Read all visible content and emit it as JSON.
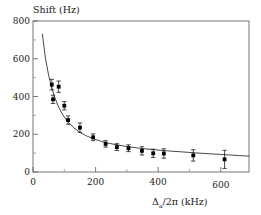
{
  "figure": {
    "background": "#ffffff",
    "frame_color": "#555555",
    "marker_color": "#000000",
    "curve_color": "#333333"
  },
  "chart_data": {
    "type": "scatter",
    "title": "",
    "subtitle": "",
    "ylabel": "Shift (Hz)",
    "xlabel": "Δₐ/2π (kHz)",
    "xlabel_parts": {
      "symbol": "Δ",
      "subscript": "a",
      "rest": "/2π (kHz)"
    },
    "xlim": [
      0,
      690
    ],
    "ylim": [
      0,
      800
    ],
    "xticks": [
      0,
      200,
      400,
      600
    ],
    "xticklabels": [
      "0",
      "200",
      "400",
      "600"
    ],
    "xminorticks": [
      100,
      300,
      500
    ],
    "yticks": [
      0,
      200,
      400,
      600,
      800
    ],
    "yticklabels": [
      "0",
      "200",
      "400",
      "600",
      "800"
    ],
    "yminorticks": [
      100,
      300,
      500,
      700
    ],
    "grid": false,
    "legend": null,
    "legend_position": "none",
    "marker_style": "square",
    "error_bars": "y",
    "series": [
      {
        "name": "measured shift",
        "type": "scatter",
        "x": [
          60,
          64,
          82,
          100,
          112,
          150,
          192,
          232,
          268,
          305,
          348,
          384,
          418,
          512,
          612
        ],
        "y": [
          463,
          385,
          452,
          351,
          275,
          235,
          184,
          149,
          132,
          126,
          112,
          99,
          98,
          88,
          67
        ],
        "yerr": [
          28,
          22,
          30,
          22,
          22,
          25,
          18,
          17,
          18,
          18,
          22,
          22,
          25,
          30,
          48
        ]
      },
      {
        "name": "fit curve",
        "type": "line",
        "x": [
          30,
          40,
          50,
          60,
          70,
          80,
          90,
          100,
          115,
          130,
          150,
          170,
          190,
          215,
          240,
          270,
          300,
          340,
          380,
          430,
          480,
          540,
          600,
          660,
          690
        ],
        "y": [
          730,
          600,
          512,
          445,
          393,
          352,
          318,
          291,
          259,
          235,
          210,
          192,
          178,
          164,
          153,
          143,
          135,
          126,
          119,
          112,
          106,
          99,
          93,
          87,
          84
        ]
      }
    ]
  }
}
